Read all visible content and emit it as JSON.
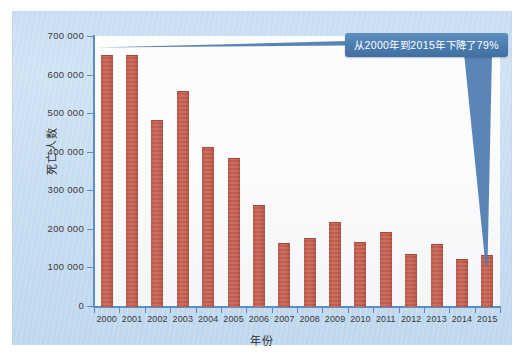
{
  "chart_data": {
    "type": "bar",
    "title": "",
    "subtitle": "",
    "xlabel": "年份",
    "ylabel": "死亡人数",
    "categories": [
      "2000",
      "2001",
      "2002",
      "2003",
      "2004",
      "2005",
      "2006",
      "2007",
      "2008",
      "2009",
      "2010",
      "2011",
      "2012",
      "2013",
      "2014",
      "2015"
    ],
    "values": [
      650000,
      650000,
      482000,
      557000,
      412000,
      384000,
      261000,
      163000,
      176000,
      218000,
      165000,
      191000,
      135000,
      160000,
      122000,
      132000
    ],
    "series": [
      {
        "name": "死亡人数",
        "values": [
          650000,
          650000,
          482000,
          557000,
          412000,
          384000,
          261000,
          163000,
          176000,
          218000,
          165000,
          191000,
          135000,
          160000,
          122000,
          132000
        ]
      }
    ],
    "ylim": [
      0,
      700000
    ],
    "y_ticks": [
      0,
      100000,
      200000,
      300000,
      400000,
      500000,
      600000,
      700000
    ],
    "y_tick_labels": [
      "0",
      "100 000",
      "200 000",
      "300 000",
      "400 000",
      "500 000",
      "600 000",
      "700 000"
    ],
    "x_tick_labels": [
      "2000",
      "2001",
      "2002",
      "2003",
      "2004",
      "2005",
      "2006",
      "2007",
      "2008",
      "2009",
      "2010",
      "2011",
      "2012",
      "2013",
      "2014",
      "2015"
    ],
    "grid": false,
    "legend": false,
    "legend_position": "none",
    "annotations": [
      {
        "text": "从2000年到2015年下降了79%",
        "points_to": "2015",
        "style": "callout-box-with-leader"
      }
    ],
    "bar_color": "#c0594a",
    "axis_color": "#5b8fc4",
    "plot_background": "#fbfbfc",
    "panel_background": "#c9def2",
    "callout_color": "#4b7cb0",
    "callout_text_color": "#ffffff"
  },
  "annotation": {
    "text": "从2000年到2015年下降了79%"
  },
  "axes": {
    "y_title": "死亡人数",
    "x_title": "年份"
  }
}
